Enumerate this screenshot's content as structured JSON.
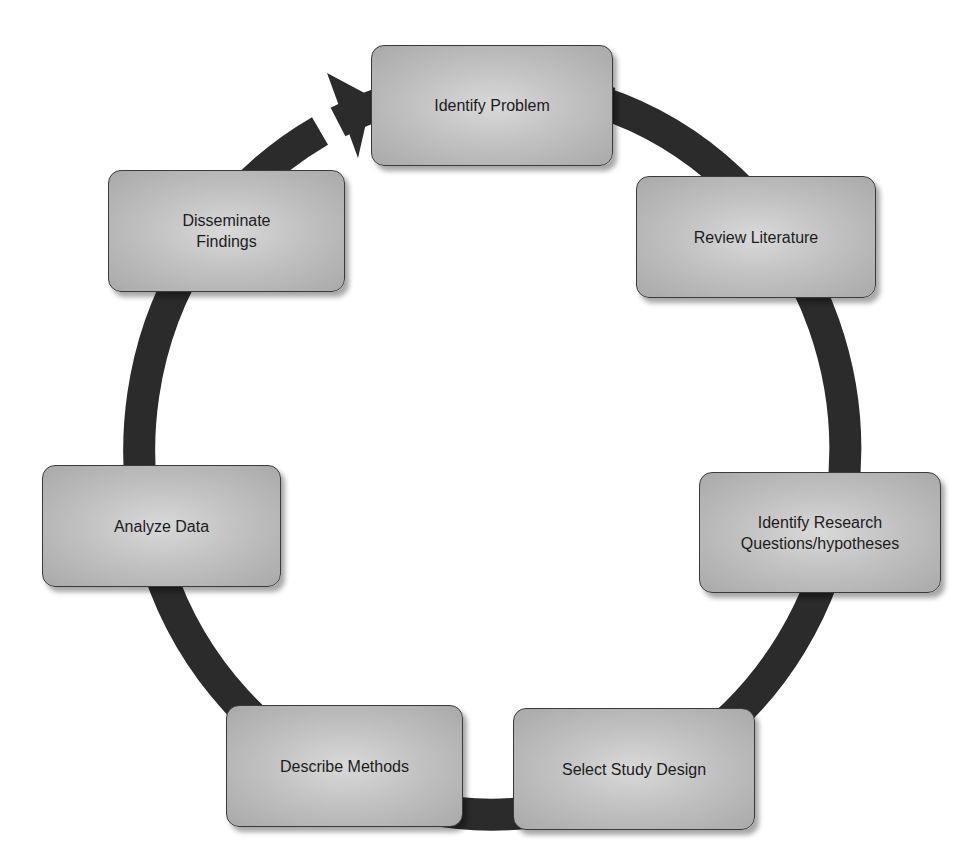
{
  "diagram": {
    "type": "cycle",
    "colors": {
      "ring": "#2b2b2b",
      "box_fill_center": "#d9d9d9",
      "box_fill_edge": "#a9a9a9",
      "box_border": "#3a3a3a",
      "text": "#1c1c1c",
      "background": "#ffffff"
    },
    "steps": [
      {
        "id": "identify-problem",
        "label": "Identify Problem",
        "x": 371,
        "y": 45,
        "w": 242,
        "h": 121
      },
      {
        "id": "review-literature",
        "label": "Review Literature",
        "x": 636,
        "y": 176,
        "w": 240,
        "h": 122
      },
      {
        "id": "identify-research-questions",
        "label": "Identify Research\nQuestions/hypotheses",
        "x": 699,
        "y": 472,
        "w": 242,
        "h": 121
      },
      {
        "id": "select-study-design",
        "label": "Select Study Design",
        "x": 513,
        "y": 708,
        "w": 242,
        "h": 122
      },
      {
        "id": "describe-methods",
        "label": "Describe Methods",
        "x": 226,
        "y": 705,
        "w": 237,
        "h": 122
      },
      {
        "id": "analyze-data",
        "label": "Analyze Data",
        "x": 42,
        "y": 465,
        "w": 239,
        "h": 122
      },
      {
        "id": "disseminate-findings",
        "label": "Disseminate\nFindings",
        "x": 108,
        "y": 170,
        "w": 237,
        "h": 122
      }
    ],
    "flow": "clockwise",
    "arrow_points_to": "Identify Problem"
  }
}
